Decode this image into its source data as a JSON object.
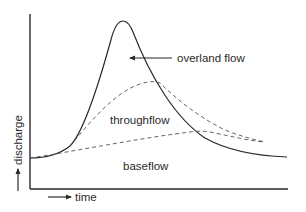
{
  "diagram": {
    "x_axis_label": "time",
    "y_axis_label": "discharge",
    "labels": {
      "overland_flow": "overland flow",
      "throughflow": "throughflow",
      "baseflow": "baseflow"
    },
    "components": [
      {
        "name": "overland flow",
        "style": "solid",
        "role": "total hydrograph (upper envelope)"
      },
      {
        "name": "throughflow",
        "style": "dashed",
        "role": "intermediate separation line"
      },
      {
        "name": "baseflow",
        "style": "dashed",
        "role": "lower separation line"
      }
    ],
    "colors": {
      "line": "#2a2a2a",
      "dashed": "#555555",
      "background": "#ffffff"
    }
  }
}
